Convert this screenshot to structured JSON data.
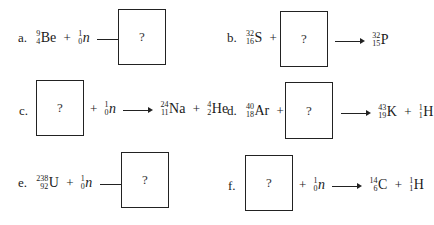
{
  "problems": [
    {
      "label": "a.",
      "reactant1": {
        "mass": "9",
        "atomic": "4",
        "symbol": "Be"
      },
      "plus": "+",
      "reactant2": {
        "mass": "1",
        "atomic": "0",
        "symbol": "n"
      },
      "unknown": "?"
    },
    {
      "label": "b.",
      "reactant1": {
        "mass": "32",
        "atomic": "16",
        "symbol": "S"
      },
      "plus": "+",
      "unknown": "?",
      "product1": {
        "mass": "32",
        "atomic": "15",
        "symbol": "P"
      }
    },
    {
      "label": "c.",
      "unknown": "?",
      "plus": "+",
      "reactant2": {
        "mass": "1",
        "atomic": "0",
        "symbol": "n"
      },
      "product1": {
        "mass": "24",
        "atomic": "11",
        "symbol": "Na"
      },
      "plus2": "+",
      "product2": {
        "mass": "4",
        "atomic": "2",
        "symbol": "He"
      }
    },
    {
      "label": "d.",
      "reactant1": {
        "mass": "40",
        "atomic": "18",
        "symbol": "Ar"
      },
      "plus": "+",
      "unknown": "?",
      "product1": {
        "mass": "43",
        "atomic": "19",
        "symbol": "K"
      },
      "plus2": "+",
      "product2": {
        "mass": "1",
        "atomic": "1",
        "symbol": "H"
      }
    },
    {
      "label": "e.",
      "reactant1": {
        "mass": "238",
        "atomic": "92",
        "symbol": "U"
      },
      "plus": "+",
      "reactant2": {
        "mass": "1",
        "atomic": "0",
        "symbol": "n"
      },
      "unknown": "?"
    },
    {
      "label": "f.",
      "unknown": "?",
      "plus": "+",
      "reactant2": {
        "mass": "1",
        "atomic": "0",
        "symbol": "n"
      },
      "product1": {
        "mass": "14",
        "atomic": "6",
        "symbol": "C"
      },
      "plus2": "+",
      "product2": {
        "mass": "1",
        "atomic": "1",
        "symbol": "H"
      }
    }
  ]
}
